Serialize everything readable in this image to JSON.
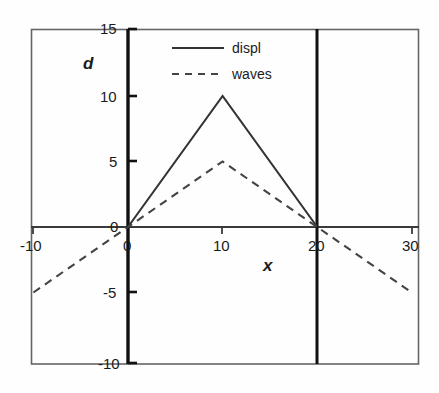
{
  "chart_data": {
    "type": "line",
    "title": "",
    "xlabel": "x",
    "ylabel": "d",
    "xlim": [
      -10,
      30
    ],
    "ylim": [
      -10,
      15
    ],
    "xticks": [
      -10,
      0,
      10,
      20,
      30
    ],
    "xtick_labels": [
      "-10",
      "0",
      "10",
      "20",
      "30"
    ],
    "yticks": [
      -10,
      -5,
      0,
      5,
      10,
      15
    ],
    "ytick_labels": [
      "-10",
      "-5",
      "0",
      "5",
      "10",
      "15"
    ],
    "grid": false,
    "legend_position": "top-center",
    "annotations": [
      "vertical reference line at x = 0",
      "vertical reference line at x = 20",
      "horizontal reference line at d = 0"
    ],
    "reference_lines": {
      "vertical_x": [
        0,
        20
      ],
      "horizontal_y": [
        0
      ]
    },
    "series": [
      {
        "name": "displ",
        "style": "solid",
        "color": "#333333",
        "x": [
          0,
          10,
          20
        ],
        "values": [
          0,
          10,
          0
        ]
      },
      {
        "name": "waves",
        "style": "dashed",
        "color": "#444444",
        "x": [
          -10,
          0,
          10,
          20,
          30
        ],
        "values": [
          -5,
          0,
          5,
          0,
          -5
        ]
      }
    ]
  },
  "legend": {
    "entries": [
      {
        "label": "displ",
        "style": "solid"
      },
      {
        "label": "waves",
        "style": "dashed"
      }
    ]
  },
  "axes": {
    "x_title": "x",
    "y_title": "d",
    "x_tick_labels": [
      "-10",
      "0",
      "10",
      "20",
      "30"
    ],
    "y_tick_labels": [
      "15",
      "10",
      "5",
      "0",
      "-5",
      "-10"
    ]
  },
  "colors": {
    "frame": "#555555",
    "axis": "#1a1a1a",
    "series_displ": "#333333",
    "series_waves": "#444444",
    "background": "#fefefe",
    "text": "#1a1a1a"
  }
}
